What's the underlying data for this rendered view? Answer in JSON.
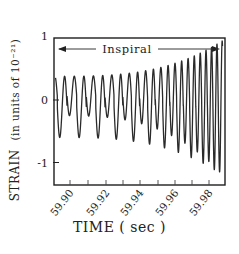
{
  "chart_data": {
    "type": "line",
    "title": "",
    "annotation": "Inspiral",
    "xlabel": "TIME ( sec )",
    "ylabel": "STRAIN",
    "ylabel_units": "(in units of 10⁻²¹)",
    "xlim": [
      59.886,
      59.995
    ],
    "ylim": [
      -1.0,
      1.0
    ],
    "x_ticks": [
      59.89,
      59.9,
      59.91,
      59.92,
      59.93,
      59.94,
      59.95,
      59.96,
      59.97,
      59.98,
      59.99
    ],
    "x_tick_labels": [
      "59.90",
      "59.92",
      "59.94",
      "59.96",
      "59.98"
    ],
    "x_tick_label_values": [
      59.9,
      59.92,
      59.94,
      59.96,
      59.98
    ],
    "y_ticks": [
      1,
      0,
      -1
    ],
    "y_tick_labels": [
      "1",
      "0",
      "-1"
    ],
    "grid": false,
    "series": [
      {
        "name": "strain (inspiral waveform)",
        "description": "Chirp: oscillation frequency and amplitude increase toward coalescence at right edge",
        "cycles_visible": 22,
        "start": {
          "t": 59.886,
          "peak": 0.38,
          "trough_shallow": -0.25,
          "trough_deep": -0.6
        },
        "end": {
          "t": 59.994,
          "peak": 0.95,
          "trough": -1.2
        }
      }
    ],
    "colors": {
      "line": "#2a2a2a",
      "frame": "#1e1e1e",
      "background": "#ffffff"
    }
  }
}
